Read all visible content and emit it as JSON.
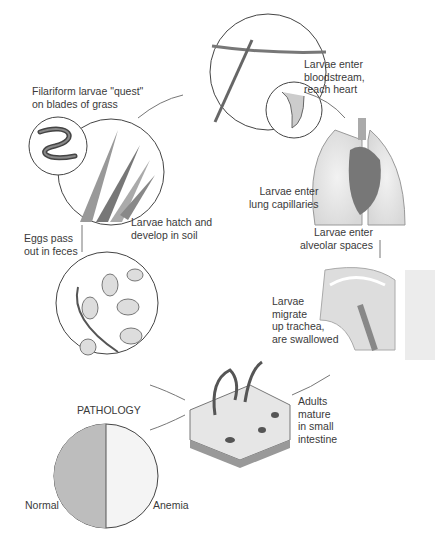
{
  "stages": [
    {
      "id": "quest",
      "label": "Filariform larvae \"quest\"\non blades of grass"
    },
    {
      "id": "bloodstream",
      "label": "Larvae enter\nbloodstream,\nreach heart"
    },
    {
      "id": "lung-capillaries",
      "label": "Larvae enter\nlung capillaries"
    },
    {
      "id": "alveolar",
      "label": "Larvae enter\nalveolar spaces"
    },
    {
      "id": "trachea",
      "label": "Larvae\nmigrate\nup trachea,\nare swallowed"
    },
    {
      "id": "intestine",
      "label": "Adults\nmature\nin small\nintestine"
    },
    {
      "id": "eggs",
      "label": "Eggs pass\nout in feces"
    },
    {
      "id": "hatch",
      "label": "Larvae hatch and\ndevelop in soil"
    }
  ],
  "pathology": {
    "title": "PATHOLOGY",
    "left_label": "Normal",
    "right_label": "Anemia"
  }
}
